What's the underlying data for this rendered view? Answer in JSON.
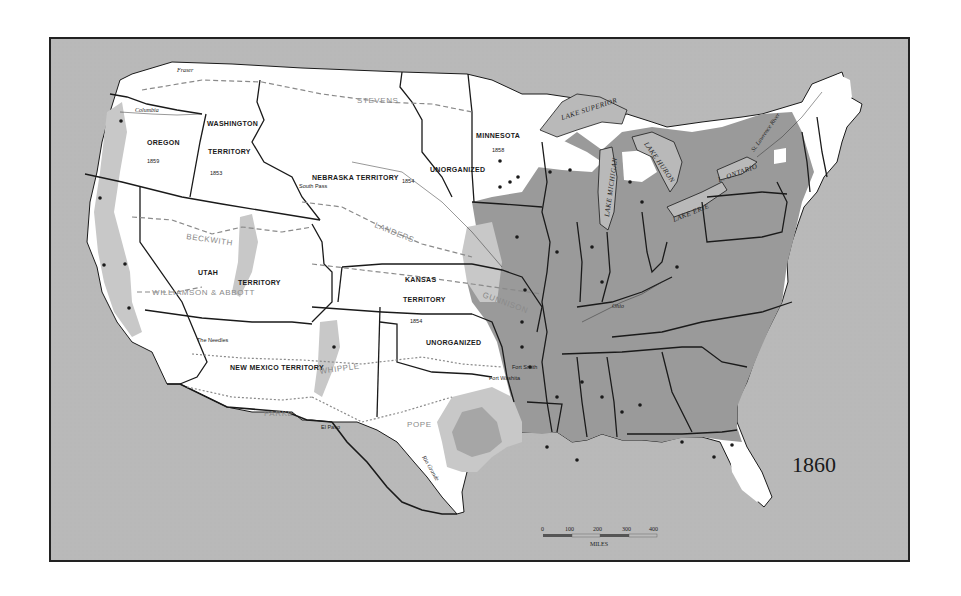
{
  "map": {
    "title_year": "1860",
    "colors": {
      "frame_border": "#222222",
      "water": "#b9b9b9",
      "unsettled_land": "#ffffff",
      "light_settlement": "#c8c8c8",
      "dense_settlement": "#9a9a9a",
      "boundary": "#1a1a1a",
      "survey_route": "#8a8a8a"
    },
    "territories": [
      {
        "name": "OREGON",
        "year": "1859"
      },
      {
        "name": "WASHINGTON",
        "sub": "TERRITORY",
        "year": "1853"
      },
      {
        "name": "NEBRASKA TERRITORY",
        "year": "1854"
      },
      {
        "name": "MINNESOTA",
        "year": "1858"
      },
      {
        "name": "UNORGANIZED",
        "region": "north"
      },
      {
        "name": "UTAH",
        "sub": "TERRITORY"
      },
      {
        "name": "KANSAS",
        "sub": "TERRITORY",
        "year": "1854"
      },
      {
        "name": "NEW MEXICO TERRITORY"
      },
      {
        "name": "UNORGANIZED",
        "region": "south"
      }
    ],
    "survey_routes": [
      "STEVENS",
      "BECKWITH",
      "LANDERS",
      "WILLIAMSON & ABBOTT",
      "GUNNISON",
      "WHIPPLE",
      "PARKE",
      "POPE"
    ],
    "places": [
      "South Pass",
      "The Needles",
      "El Paso",
      "Fort Smith",
      "Fort Washita"
    ],
    "lakes": [
      "LAKE SUPERIOR",
      "LAKE MICHIGAN",
      "LAKE HURON",
      "LAKE ERIE",
      "L. ONTARIO"
    ],
    "rivers": [
      "Columbia",
      "Fraser",
      "St. Lawrence River",
      "Ohio",
      "Rio Grande"
    ],
    "scale": {
      "ticks": [
        "0",
        "100",
        "200",
        "300",
        "400"
      ],
      "unit": "MILES"
    }
  }
}
